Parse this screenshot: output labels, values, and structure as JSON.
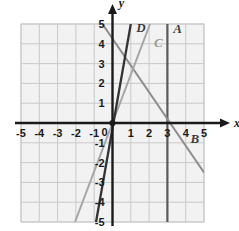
{
  "figure": {
    "kind": "coordinate-plane-graph",
    "background": "#ffffff",
    "grid_color": "#c9c9c9",
    "panel_fill": "#f2f2f2",
    "axis_color": "#1a1a1a"
  },
  "axes": {
    "x_axis_label": "x",
    "y_axis_label": "y",
    "x_min": -5,
    "x_max": 5,
    "y_min": -5,
    "y_max": 5,
    "x_ticks": [
      "-5",
      "-4",
      "-3",
      "-2",
      "-1",
      "0",
      "1",
      "2",
      "3",
      "4",
      "5"
    ],
    "y_ticks": [
      "5",
      "4",
      "3",
      "2",
      "1",
      "0",
      "-1",
      "-2",
      "-3",
      "-4",
      "-5"
    ],
    "origin_label": "0",
    "origin_dot": true
  },
  "chart_data": {
    "type": "line",
    "title": "",
    "xlabel": "x",
    "ylabel": "y",
    "xlim": [
      -5,
      5
    ],
    "ylim": [
      -5,
      5
    ],
    "grid": true,
    "legend": "inline-labels",
    "series": [
      {
        "name": "A",
        "label": "A",
        "color": "#5a5a5a",
        "width": 2.2,
        "description": "vertical line",
        "equation": "x = 3",
        "points": [
          [
            3,
            5
          ],
          [
            3,
            -5
          ]
        ],
        "label_x": 3.55,
        "label_y": 4.55
      },
      {
        "name": "B",
        "label": "B",
        "color": "#8c8c8c",
        "width": 2.0,
        "description": "decreasing line",
        "equation": "y = -1.4x + 4.3",
        "points": [
          [
            -0.55,
            5
          ],
          [
            5,
            -2.5
          ]
        ],
        "label_x": 4.5,
        "label_y": -1.0
      },
      {
        "name": "C",
        "label": "C",
        "color": "#a6a6a6",
        "width": 2.0,
        "description": "increasing line through origin",
        "equation": "y = 2.5x",
        "points": [
          [
            -2.05,
            -5
          ],
          [
            2.05,
            5
          ]
        ],
        "label_x": 2.5,
        "label_y": 3.85
      },
      {
        "name": "D",
        "label": "D",
        "color": "#333333",
        "width": 2.3,
        "description": "steep increasing line through origin",
        "equation": "y = 5x",
        "points": [
          [
            -0.9,
            -5
          ],
          [
            1.0,
            5
          ]
        ],
        "label_x": 1.55,
        "label_y": 4.6
      }
    ]
  }
}
